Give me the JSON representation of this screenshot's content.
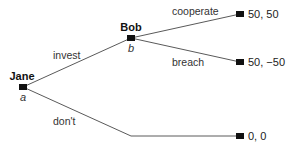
{
  "tree": {
    "nodes": {
      "jane": {
        "player": "Jane",
        "id": "a"
      },
      "bob": {
        "player": "Bob",
        "id": "b"
      }
    },
    "actions": {
      "invest": "invest",
      "dont": "don't",
      "cooperate": "cooperate",
      "breach": "breach"
    },
    "payoffs": {
      "cooperate": "50, 50",
      "breach": "50, −50",
      "dont": "0, 0"
    }
  }
}
